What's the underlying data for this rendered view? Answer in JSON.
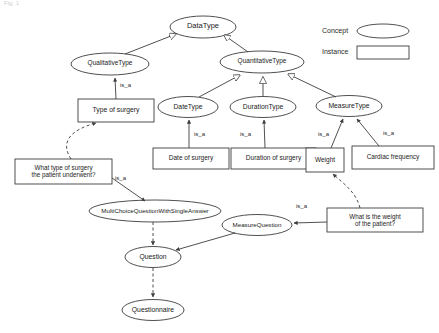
{
  "figure": {
    "caption": "Fig. 1"
  },
  "legend": {
    "concept_label": "Concept",
    "instance_label": "Instance",
    "concept_shape": "ellipse-icon",
    "instance_shape": "rectangle-icon"
  },
  "colors": {
    "stroke": "#3c3c3c",
    "text": "#1a1a1a",
    "background": "#ffffff"
  },
  "concepts": [
    {
      "id": "datatype",
      "label": "DataType"
    },
    {
      "id": "qualitativetype",
      "label": "QualitativeType"
    },
    {
      "id": "quantitativetype",
      "label": "QuantitativeType"
    },
    {
      "id": "datetype",
      "label": "DateType"
    },
    {
      "id": "durationtype",
      "label": "DurationType"
    },
    {
      "id": "measuretype",
      "label": "MeasureType"
    },
    {
      "id": "multichoicequestionwithsingleanswer",
      "label": "MultiChoiceQuestionWithSingleAnswer"
    },
    {
      "id": "measurequestion",
      "label": "MeasureQuestion"
    },
    {
      "id": "question",
      "label": "Question"
    },
    {
      "id": "questionnaire",
      "label": "Questionnaire"
    }
  ],
  "instances": [
    {
      "id": "type-of-surgery",
      "label": "Type of surgery"
    },
    {
      "id": "date-of-surgery",
      "label": "Date of surgery"
    },
    {
      "id": "duration-of-surgery",
      "label": "Duration of surgery"
    },
    {
      "id": "weight",
      "label": "Weight"
    },
    {
      "id": "cardiac-frequency",
      "label": "Cardiac frequency"
    },
    {
      "id": "what-type-of-surgery",
      "label": "What type of surgery\nthe patient underwent?"
    },
    {
      "id": "what-is-the-weight",
      "label": "What is the weight\nof the patient?"
    }
  ],
  "edge_labels": [
    {
      "id": "is-a-type-of-surgery",
      "label": "is_a"
    },
    {
      "id": "is-a-date-of-surgery",
      "label": "is_a"
    },
    {
      "id": "is-a-duration-of-surgery",
      "label": "is_a"
    },
    {
      "id": "is-a-weight",
      "label": "is_a"
    },
    {
      "id": "is-a-cardiac-frequency",
      "label": "is_a"
    },
    {
      "id": "is-a-what-type-of-surgery",
      "label": "is_a"
    },
    {
      "id": "is-a-what-is-the-weight",
      "label": "is_a"
    }
  ]
}
